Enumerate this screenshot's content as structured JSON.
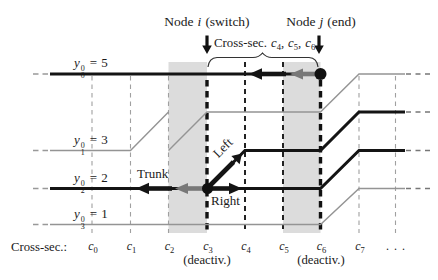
{
  "figure": {
    "title_nodes": {
      "i": {
        "prefix": "Node",
        "var": "i",
        "suffix": "(switch)"
      },
      "j": {
        "prefix": "Node",
        "var": "j",
        "suffix": "(end)"
      }
    },
    "cross_sec_annotation": {
      "prefix": "Cross-sec.",
      "sep": ",",
      "items": [
        {
          "base": "c",
          "sub": "4"
        },
        {
          "base": "c",
          "sub": "5"
        },
        {
          "base": "c",
          "sub": "6"
        }
      ]
    },
    "track_labels": [
      {
        "var": "y",
        "sub": "0",
        "sup": "0",
        "eq": "=",
        "val": "5"
      },
      {
        "var": "y",
        "sub": "1",
        "sup": "0",
        "eq": "=",
        "val": "3"
      },
      {
        "var": "y",
        "sub": "2",
        "sup": "0",
        "eq": "=",
        "val": "2"
      },
      {
        "var": "y",
        "sub": "3",
        "sup": "0",
        "eq": "=",
        "val": "1"
      }
    ],
    "branch_labels": {
      "trunk": "Trunk",
      "left": "Left",
      "right": "Right"
    },
    "axis": {
      "title": "Cross-sec.:",
      "ticks": [
        {
          "base": "c",
          "sub": "0"
        },
        {
          "base": "c",
          "sub": "1"
        },
        {
          "base": "c",
          "sub": "2"
        },
        {
          "base": "c",
          "sub": "3"
        },
        {
          "base": "c",
          "sub": "4"
        },
        {
          "base": "c",
          "sub": "5"
        },
        {
          "base": "c",
          "sub": "6"
        },
        {
          "base": "c",
          "sub": "7"
        }
      ],
      "ellipsis": ". . .",
      "deactivated": [
        "(deactiv.)",
        "(deactiv.)"
      ]
    },
    "colors": {
      "track": "#141414",
      "secondary_track": "#949494",
      "highlight_band": "#dcdcdc",
      "direction_arrow_gray": "#787878",
      "text": "#1a1a1a"
    }
  }
}
